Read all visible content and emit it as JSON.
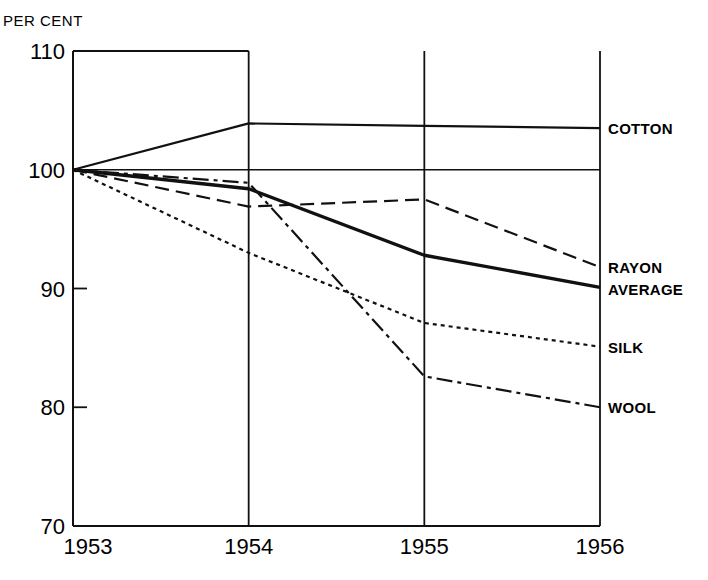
{
  "chart_data": {
    "type": "line",
    "title": "",
    "ylabel": "PER CENT",
    "xlabel": "",
    "x": [
      "1953",
      "1954",
      "1955",
      "1956"
    ],
    "ylim": [
      70,
      110
    ],
    "yticks": [
      "110",
      "100",
      "90",
      "80",
      "70"
    ],
    "grid": {
      "vertical": true,
      "reference_line_y": 100
    },
    "legend": "inline labels at right end of each line",
    "series": [
      {
        "name": "COTTON",
        "style": "solid",
        "weight": "medium",
        "values": [
          100,
          103.9,
          103.7,
          103.5
        ]
      },
      {
        "name": "RAYON",
        "style": "dashed",
        "weight": "medium",
        "values": [
          100,
          96.9,
          97.5,
          91.8
        ]
      },
      {
        "name": "AVERAGE",
        "style": "solid",
        "weight": "heavy",
        "values": [
          100,
          98.4,
          92.8,
          90.1
        ]
      },
      {
        "name": "SILK",
        "style": "dotted",
        "weight": "medium",
        "values": [
          100,
          93.0,
          87.1,
          85.1
        ]
      },
      {
        "name": "WOOL",
        "style": "dash-dot",
        "weight": "medium",
        "values": [
          100,
          98.9,
          82.6,
          80.0
        ]
      }
    ]
  }
}
